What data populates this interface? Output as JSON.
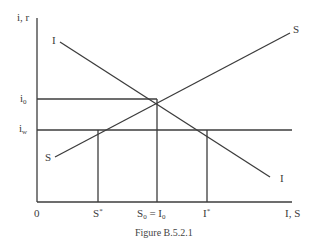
{
  "figure": {
    "caption": "Figure B.5.2.1",
    "y_axis_label": "i, r",
    "x_axis_label": "I, S",
    "origin_label": "0",
    "y_ticks": {
      "i0": {
        "base": "i",
        "sub": "0"
      },
      "iw": {
        "base": "i",
        "sub": "w"
      }
    },
    "x_ticks": {
      "s_star": {
        "base": "S",
        "sup": "*"
      },
      "s0_eq_i0": {
        "base1": "S",
        "sub1": "0",
        "mid": " = ",
        "base2": "I",
        "sub2": "0"
      },
      "i_star": {
        "base": "I",
        "sup": "*"
      }
    },
    "curves": {
      "saving_start_label": "S",
      "saving_end_label": "S",
      "investment_start_label": "I",
      "investment_end_label": "I"
    },
    "colors": {
      "line": "#3c3c3c",
      "background": "#ffffff"
    }
  }
}
